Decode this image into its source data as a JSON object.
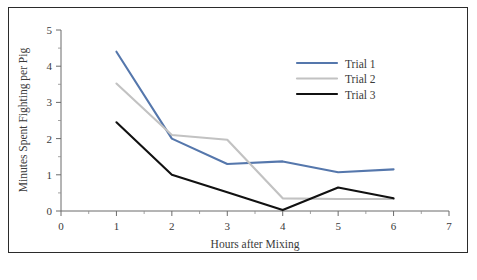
{
  "chart_data": {
    "type": "line",
    "title": "",
    "xlabel": "Hours after Mixing",
    "ylabel": "Minutes Spent Fighting per Pig",
    "x": [
      1,
      2,
      3,
      4,
      5,
      6
    ],
    "xlim": [
      0,
      7
    ],
    "ylim": [
      0,
      5
    ],
    "xticks": [
      0,
      1,
      2,
      3,
      4,
      5,
      6,
      7
    ],
    "yticks": [
      0,
      1,
      2,
      3,
      4,
      5
    ],
    "xtick_labels": [
      "0",
      "1",
      "2",
      "3",
      "4",
      "5",
      "6",
      "7"
    ],
    "ytick_labels": [
      "0",
      "1",
      "2",
      "3",
      "4",
      "5"
    ],
    "minor_ticks": true,
    "grid": false,
    "legend_position": "upper-right",
    "series": [
      {
        "name": "Trial 1",
        "color": "#5577ac",
        "values": [
          4.4,
          2.0,
          1.3,
          1.37,
          1.07,
          1.15
        ]
      },
      {
        "name": "Trial 2",
        "color": "#c2c2c2",
        "values": [
          3.52,
          2.1,
          1.97,
          0.35,
          0.33,
          0.33
        ]
      },
      {
        "name": "Trial 3",
        "color": "#111111",
        "values": [
          2.45,
          1.0,
          0.52,
          0.03,
          0.65,
          0.35
        ]
      }
    ]
  },
  "axes": {
    "x_title": "Hours after Mixing",
    "y_title": "Minutes Spent Fighting per Pig",
    "x_labels": [
      "0",
      "1",
      "2",
      "3",
      "4",
      "5",
      "6",
      "7"
    ],
    "y_labels": [
      "0",
      "1",
      "2",
      "3",
      "4",
      "5"
    ]
  },
  "legend": {
    "items": [
      {
        "label": "Trial 1",
        "color": "#5577ac"
      },
      {
        "label": "Trial 2",
        "color": "#c2c2c2"
      },
      {
        "label": "Trial 3",
        "color": "#111111"
      }
    ]
  },
  "colors": {
    "frame": "#2b2b2b",
    "axis": "#6b6b6b",
    "text": "#3a3a3a",
    "background": "#ffffff"
  }
}
